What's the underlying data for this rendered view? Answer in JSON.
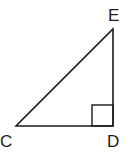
{
  "diagram": {
    "type": "right-triangle",
    "stroke_color": "#1a1a1a",
    "vertices": {
      "C": {
        "label": "C",
        "x": 16,
        "y": 126
      },
      "D": {
        "label": "D",
        "x": 113,
        "y": 126
      },
      "E": {
        "label": "E",
        "x": 113,
        "y": 29
      }
    },
    "right_angle_at": "D",
    "labels": {
      "E": "E",
      "C": "C",
      "D": "D"
    }
  }
}
